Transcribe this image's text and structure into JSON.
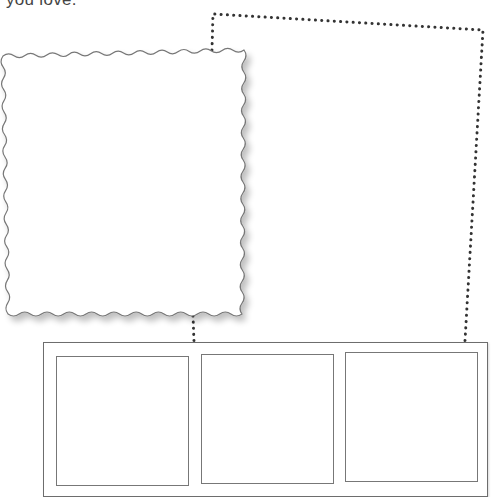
{
  "caption": {
    "text": "you love."
  },
  "wavy_photo": {
    "label": "wavy-edged photo placeholder"
  },
  "dotted_frame": {
    "label": "dotted outline placeholder"
  },
  "filmstrip": {
    "panels": [
      {
        "label": "panel 1"
      },
      {
        "label": "panel 2"
      },
      {
        "label": "panel 3"
      }
    ]
  },
  "colors": {
    "stroke": "#6d6d6d",
    "dots": "#333333",
    "background": "#ffffff"
  }
}
